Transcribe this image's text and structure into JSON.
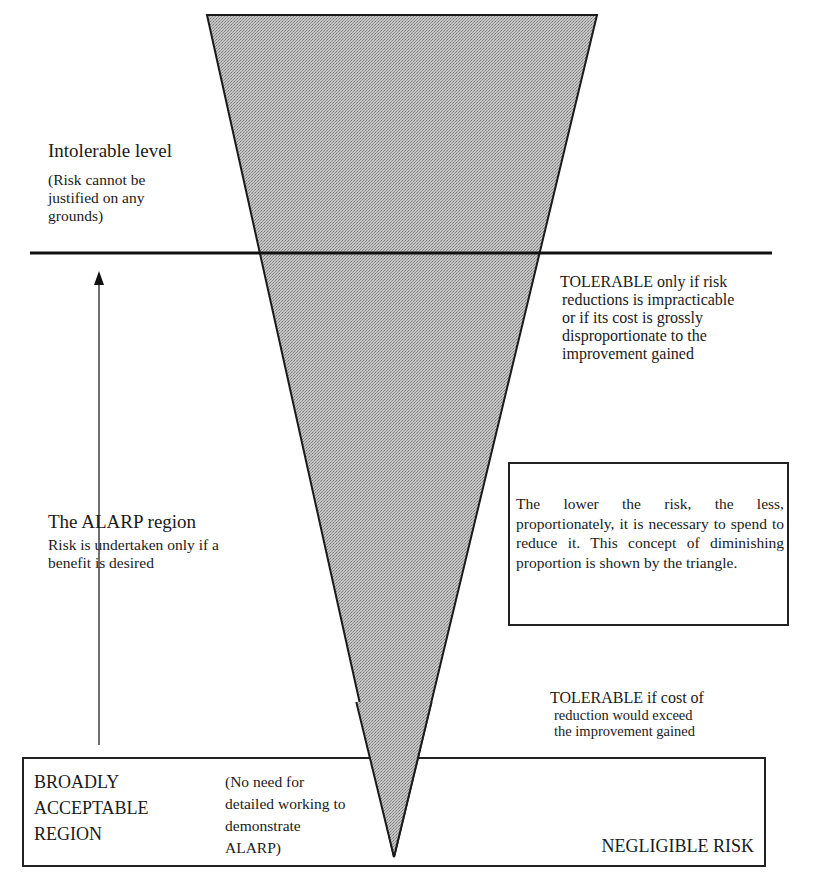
{
  "diagram": {
    "type": "ALARP triangle (risk tolerability framework)",
    "colors": {
      "triangle_fill": "#b4b4b4",
      "lines": "#1a1a1a",
      "background": "#ffffff"
    },
    "intolerable": {
      "title": "Intolerable level",
      "line1": "(Risk cannot be",
      "line2": "justified on any",
      "line3": "grounds)"
    },
    "tolerable_upper": {
      "line1": "TOLERABLE only if risk",
      "line2": "reductions is impracticable",
      "line3": "or if its cost is grossly",
      "line4": "disproportionate to the",
      "line5": "improvement gained"
    },
    "alarp": {
      "title": "The ALARP region",
      "line1": "Risk is undertaken only if a",
      "line2": "benefit is desired"
    },
    "info_box": {
      "text": "The lower the risk, the less, proportionately, it is necessary to spend to reduce it.  This concept of diminishing proportion is shown by the triangle."
    },
    "tolerable_lower": {
      "line1": "TOLERABLE if cost of",
      "line2": "reduction would exceed",
      "line3": "the improvement gained"
    },
    "broadly_acceptable": {
      "line1": "BROADLY",
      "line2": "ACCEPTABLE",
      "line3": "REGION",
      "note1": "(No need for",
      "note2": "detailed working to",
      "note3": "demonstrate",
      "note4": "ALARP)",
      "negligible": "NEGLIGIBLE RISK"
    },
    "arrow": {
      "direction": "up",
      "meaning": "increasing risk"
    }
  }
}
